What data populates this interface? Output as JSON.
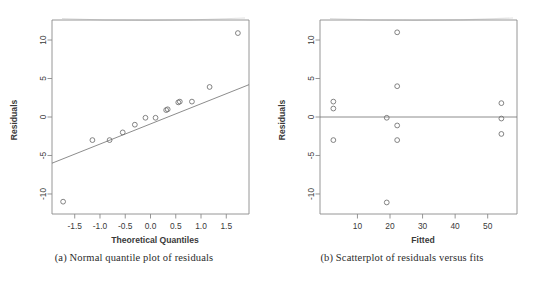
{
  "figure": {
    "panels": [
      {
        "id": "panel-a",
        "caption": "(a) Normal quantile plot of residuals"
      },
      {
        "id": "panel-b",
        "caption": "(b) Scatterplot of residuals versus fits"
      }
    ]
  },
  "chart_data": [
    {
      "type": "scatter",
      "id": "normal-quantile-plot",
      "title": "",
      "xlabel": "Theoretical Quantiles",
      "ylabel": "Residuals",
      "xlim": [
        -1.95,
        1.95
      ],
      "ylim": [
        -12.6,
        12.6
      ],
      "xticks": [
        -1.5,
        -1.0,
        -0.5,
        0.0,
        0.5,
        1.0,
        1.5
      ],
      "xticklabels": [
        "-1.5",
        "-1.0",
        "-0.5",
        "0.0",
        "0.5",
        "1.0",
        "1.5"
      ],
      "yticks": [
        -10,
        -5,
        0,
        5,
        10
      ],
      "yticklabels": [
        "-10",
        "-5",
        "0",
        "5",
        "10"
      ],
      "grid": false,
      "legend": null,
      "x": [
        -1.73,
        -1.15,
        -0.81,
        -0.55,
        -0.31,
        -0.1,
        0.1,
        0.31,
        0.34,
        0.55,
        0.58,
        0.82,
        1.17,
        1.73
      ],
      "y": [
        -11.0,
        -3.0,
        -3.0,
        -2.0,
        -1.0,
        -0.1,
        -0.1,
        0.9,
        1.0,
        1.9,
        2.0,
        2.0,
        3.9,
        10.9
      ],
      "reference_line": {
        "name": "qq-line",
        "x1": -1.95,
        "y1": -6.0,
        "x2": 1.95,
        "y2": 4.2
      }
    },
    {
      "type": "scatter",
      "id": "residuals-vs-fits-plot",
      "title": "",
      "xlabel": "Fitted",
      "ylabel": "Residuals",
      "xlim": [
        -1.5,
        59.0
      ],
      "ylim": [
        -12.6,
        12.6
      ],
      "xticks": [
        10,
        20,
        30,
        40,
        50
      ],
      "xticklabels": [
        "10",
        "20",
        "30",
        "40",
        "50"
      ],
      "yticks": [
        -10,
        -5,
        0,
        5,
        10
      ],
      "yticklabels": [
        "-10",
        "-5",
        "0",
        "5",
        "10"
      ],
      "grid": false,
      "legend": null,
      "x": [
        2.6,
        2.6,
        2.6,
        19.0,
        19.0,
        22.2,
        22.2,
        22.2,
        22.2,
        54.2,
        54.2,
        54.2
      ],
      "y": [
        2.0,
        1.1,
        -3.0,
        -0.1,
        -11.1,
        11.0,
        4.0,
        -1.1,
        -3.0,
        1.8,
        -0.2,
        -2.2
      ],
      "reference_line": {
        "name": "zero-line",
        "x1": -1.5,
        "y1": 0,
        "x2": 59.0,
        "y2": 0
      }
    }
  ]
}
